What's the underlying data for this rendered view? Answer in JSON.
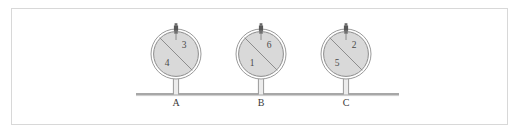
{
  "figure": {
    "title": "",
    "frame": {
      "border_color": "#d8d8d8",
      "background_color": "#ffffff"
    },
    "ground": {
      "name": "ground-line",
      "color": "#8a8a8a",
      "x_start": 136,
      "x_end": 399,
      "y": 94
    },
    "colors": {
      "disc_fill": "#d9d9d9",
      "disc_stroke": "#8c8c8c",
      "divider_stroke": "#8c8c8c",
      "stem_color": "#9a9a9a",
      "valve_color": "#585858",
      "number_color": "#4a4a4a",
      "label_color": "#3a3a3a"
    },
    "units": [
      {
        "station_label": "A",
        "center_x": 176,
        "center_y": 54,
        "radius": 25,
        "upper_number": "3",
        "lower_number": "4"
      },
      {
        "station_label": "B",
        "center_x": 261,
        "center_y": 54,
        "radius": 25,
        "upper_number": "6",
        "lower_number": "1"
      },
      {
        "station_label": "C",
        "center_x": 346,
        "center_y": 54,
        "radius": 25,
        "upper_number": "2",
        "lower_number": "5"
      }
    ]
  }
}
